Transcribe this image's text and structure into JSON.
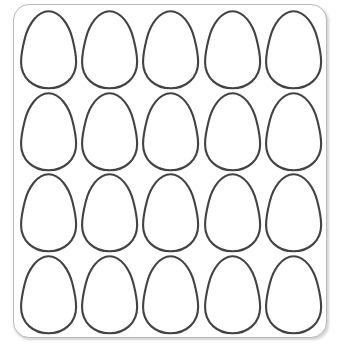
{
  "page": {
    "title": "Egg Outline Template Sheet",
    "background_color": "#ffffff"
  },
  "sheet": {
    "name": "egg-template-sheet",
    "border_color": "#b9b9b9",
    "fill_color": "#ffffff",
    "corner_radius": "16px",
    "shadow_color": "rgba(120,120,120,0.33)"
  },
  "grid": {
    "columns": 5,
    "rows": 4,
    "total_shapes": 20,
    "shape_name": "egg-outline",
    "stroke_color": "#434343",
    "fill_color": "#ffffff",
    "stroke_width": "2.1"
  },
  "eggs": [
    {
      "id": 1,
      "row": 1,
      "col": 1,
      "label": "egg-r1c1"
    },
    {
      "id": 2,
      "row": 1,
      "col": 2,
      "label": "egg-r1c2"
    },
    {
      "id": 3,
      "row": 1,
      "col": 3,
      "label": "egg-r1c3"
    },
    {
      "id": 4,
      "row": 1,
      "col": 4,
      "label": "egg-r1c4"
    },
    {
      "id": 5,
      "row": 1,
      "col": 5,
      "label": "egg-r1c5"
    },
    {
      "id": 6,
      "row": 2,
      "col": 1,
      "label": "egg-r2c1"
    },
    {
      "id": 7,
      "row": 2,
      "col": 2,
      "label": "egg-r2c2"
    },
    {
      "id": 8,
      "row": 2,
      "col": 3,
      "label": "egg-r2c3"
    },
    {
      "id": 9,
      "row": 2,
      "col": 4,
      "label": "egg-r2c4"
    },
    {
      "id": 10,
      "row": 2,
      "col": 5,
      "label": "egg-r2c5"
    },
    {
      "id": 11,
      "row": 3,
      "col": 1,
      "label": "egg-r3c1"
    },
    {
      "id": 12,
      "row": 3,
      "col": 2,
      "label": "egg-r3c2"
    },
    {
      "id": 13,
      "row": 3,
      "col": 3,
      "label": "egg-r3c3"
    },
    {
      "id": 14,
      "row": 3,
      "col": 4,
      "label": "egg-r3c4"
    },
    {
      "id": 15,
      "row": 3,
      "col": 5,
      "label": "egg-r3c5"
    },
    {
      "id": 16,
      "row": 4,
      "col": 1,
      "label": "egg-r4c1"
    },
    {
      "id": 17,
      "row": 4,
      "col": 2,
      "label": "egg-r4c2"
    },
    {
      "id": 18,
      "row": 4,
      "col": 3,
      "label": "egg-r4c3"
    },
    {
      "id": 19,
      "row": 4,
      "col": 4,
      "label": "egg-r4c4"
    },
    {
      "id": 20,
      "row": 4,
      "col": 5,
      "label": "egg-r4c5"
    }
  ]
}
